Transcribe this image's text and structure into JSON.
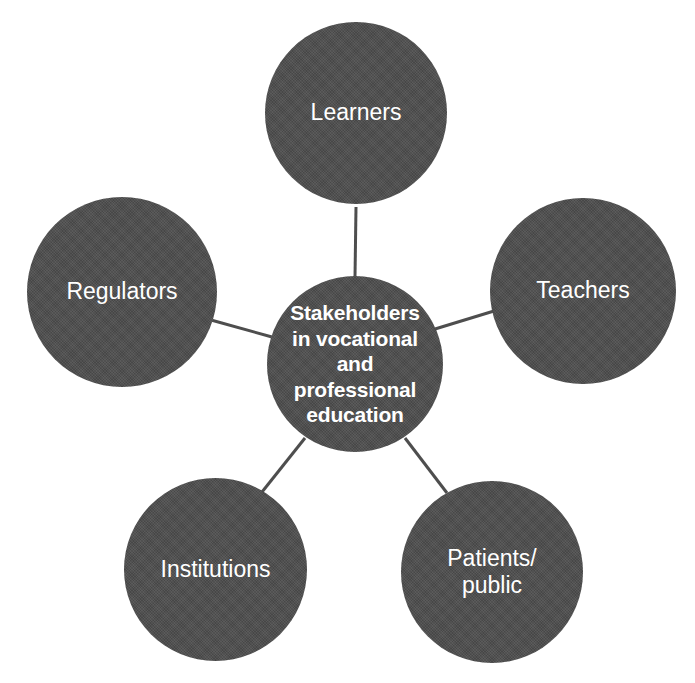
{
  "diagram": {
    "title": "Stakeholders in vocational and professional education",
    "type": "hub-and-spoke",
    "background_color": "#ffffff",
    "node_fill_color": "#4e4e4e",
    "node_text_color": "#ffffff",
    "connector_color": "#4e4e4e",
    "hub": {
      "id": "hub",
      "label": "Stakeholders\nin vocational\nand\nprofessional\neducation",
      "lines": [
        "Stakeholders",
        "in vocational",
        "and",
        "professional",
        "education"
      ],
      "bold": true,
      "center": [
        355,
        364
      ],
      "radius": 88
    },
    "nodes": [
      {
        "id": "learners",
        "label": "Learners",
        "lines": [
          "Learners"
        ],
        "center": [
          356,
          113
        ],
        "radius": 91
      },
      {
        "id": "teachers",
        "label": "Teachers",
        "lines": [
          "Teachers"
        ],
        "center": [
          583,
          291
        ],
        "radius": 93
      },
      {
        "id": "patients-public",
        "label": "Patients/\npublic",
        "lines": [
          "Patients/",
          "public"
        ],
        "center": [
          492,
          572
        ],
        "radius": 91
      },
      {
        "id": "institutions",
        "label": "Institutions",
        "lines": [
          "Institutions"
        ],
        "center": [
          215,
          569
        ],
        "radius": 92
      },
      {
        "id": "regulators",
        "label": "Regulators",
        "lines": [
          "Regulators"
        ],
        "center": [
          122,
          292
        ],
        "radius": 95
      }
    ],
    "connectors": [
      {
        "id": "hub-learners",
        "from": "hub",
        "to": "learners",
        "x1": 355,
        "y1": 277,
        "x2": 356,
        "y2": 207
      },
      {
        "id": "hub-teachers",
        "from": "hub",
        "to": "teachers",
        "x1": 435,
        "y1": 329,
        "x2": 494,
        "y2": 311
      },
      {
        "id": "hub-patients",
        "from": "hub",
        "to": "patients-public",
        "x1": 405,
        "y1": 438,
        "x2": 447,
        "y2": 493
      },
      {
        "id": "hub-institutions",
        "from": "hub",
        "to": "institutions",
        "x1": 305,
        "y1": 438,
        "x2": 262,
        "y2": 492
      },
      {
        "id": "hub-regulators",
        "from": "hub",
        "to": "regulators",
        "x1": 272,
        "y1": 337,
        "x2": 211,
        "y2": 320
      }
    ]
  }
}
